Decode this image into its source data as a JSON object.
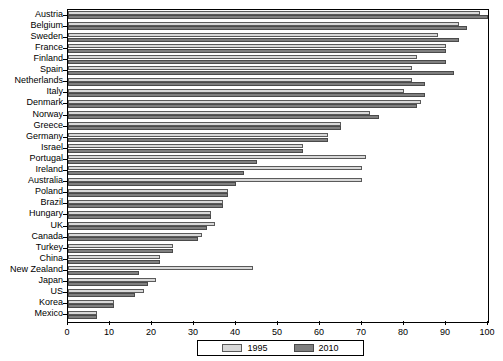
{
  "chart_data": {
    "type": "bar",
    "orientation": "horizontal",
    "title": "",
    "xlabel": "",
    "ylabel": "",
    "xlim": [
      0,
      100
    ],
    "xticks": [
      0,
      10,
      20,
      30,
      40,
      50,
      60,
      70,
      80,
      90,
      100
    ],
    "grid": false,
    "legend_position": "bottom",
    "categories": [
      "Austria",
      "Belgium",
      "Sweden",
      "France",
      "Finland",
      "Spain",
      "Netherlands",
      "Italy",
      "Denmark",
      "Norway",
      "Greece",
      "Germany",
      "Israel",
      "Portugal",
      "Ireland",
      "Australia",
      "Poland",
      "Brazil",
      "Hungary",
      "UK",
      "Canada",
      "Turkey",
      "China",
      "New Zealand",
      "Japan",
      "US",
      "Korea",
      "Mexico"
    ],
    "series": [
      {
        "name": "1995",
        "color": "#d8d8d8",
        "values": [
          98,
          93,
          88,
          90,
          83,
          82,
          82,
          80,
          84,
          72,
          65,
          62,
          56,
          71,
          70,
          70,
          38,
          37,
          34,
          35,
          32,
          25,
          22,
          44,
          21,
          18,
          11,
          7
        ]
      },
      {
        "name": "2010",
        "color": "#7f7f7f",
        "values": [
          100,
          95,
          93,
          90,
          90,
          92,
          85,
          85,
          83,
          74,
          65,
          62,
          56,
          45,
          42,
          40,
          38,
          37,
          34,
          33,
          31,
          25,
          22,
          17,
          19,
          16,
          11,
          7
        ]
      }
    ]
  },
  "legend": {
    "items": [
      {
        "label": "1995",
        "key": "y1995"
      },
      {
        "label": "2010",
        "key": "y2010"
      }
    ]
  }
}
